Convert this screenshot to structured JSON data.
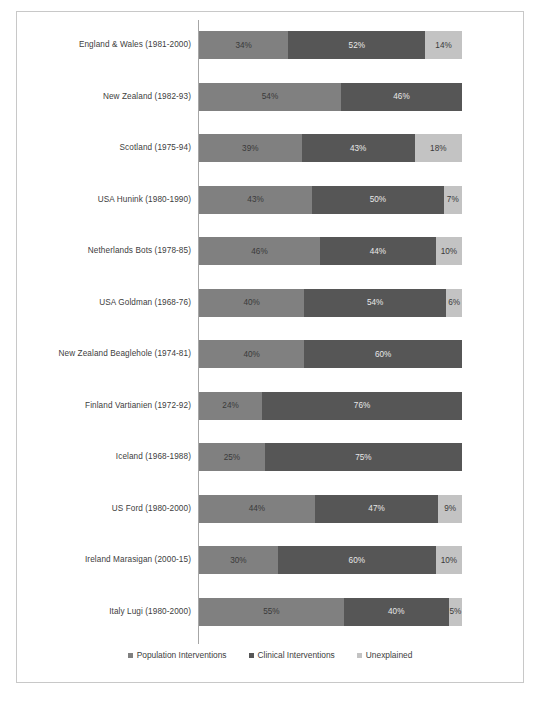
{
  "chart_data": {
    "type": "bar",
    "orientation": "horizontal",
    "stacked": true,
    "stacked_percent": true,
    "title": "",
    "xlabel": "",
    "ylabel": "",
    "xlim": [
      0,
      100
    ],
    "grid": false,
    "legend_position": "bottom",
    "legend": [
      "Population Interventions",
      "Clinical Interventions",
      "Unexplained"
    ],
    "colors": [
      "#808080",
      "#565656",
      "#c3c3c3"
    ],
    "categories": [
      "England & Wales (1981-2000)",
      "New Zealand (1982-93)",
      "Scotland (1975-94)",
      "USA Hunink (1980-1990)",
      "Netherlands Bots (1978-85)",
      "USA Goldman (1968-76)",
      "New Zealand  Beaglehole (1974-81)",
      "Finland Vartianien (1972-92)",
      "Iceland (1968-1988)",
      "US Ford (1980-2000)",
      "Ireland Marasigan (2000-15)",
      "Italy Lugi (1980-2000)"
    ],
    "series": [
      {
        "name": "Population Interventions",
        "values": [
          34,
          54,
          39,
          43,
          46,
          40,
          40,
          24,
          25,
          44,
          30,
          55
        ]
      },
      {
        "name": "Clinical Interventions",
        "values": [
          52,
          46,
          43,
          50,
          44,
          54,
          60,
          76,
          75,
          47,
          60,
          40
        ]
      },
      {
        "name": "Unexplained",
        "values": [
          14,
          0,
          18,
          7,
          10,
          6,
          0,
          0,
          0,
          9,
          10,
          5
        ]
      }
    ],
    "rows": [
      {
        "label": "England & Wales (1981-2000)",
        "segments": [
          {
            "value": 34,
            "label": "34%"
          },
          {
            "value": 52,
            "label": "52%"
          },
          {
            "value": 14,
            "label": "14%"
          }
        ]
      },
      {
        "label": "New Zealand (1982-93)",
        "segments": [
          {
            "value": 54,
            "label": "54%"
          },
          {
            "value": 46,
            "label": "46%"
          },
          {
            "value": 0,
            "label": ""
          }
        ]
      },
      {
        "label": "Scotland (1975-94)",
        "segments": [
          {
            "value": 39,
            "label": "39%"
          },
          {
            "value": 43,
            "label": "43%"
          },
          {
            "value": 18,
            "label": "18%"
          }
        ]
      },
      {
        "label": "USA Hunink (1980-1990)",
        "segments": [
          {
            "value": 43,
            "label": "43%"
          },
          {
            "value": 50,
            "label": "50%"
          },
          {
            "value": 7,
            "label": "7%"
          }
        ]
      },
      {
        "label": "Netherlands Bots (1978-85)",
        "segments": [
          {
            "value": 46,
            "label": "46%"
          },
          {
            "value": 44,
            "label": "44%"
          },
          {
            "value": 10,
            "label": "10%"
          }
        ]
      },
      {
        "label": "USA Goldman (1968-76)",
        "segments": [
          {
            "value": 40,
            "label": "40%"
          },
          {
            "value": 54,
            "label": "54%"
          },
          {
            "value": 6,
            "label": "6%"
          }
        ]
      },
      {
        "label": "New Zealand  Beaglehole (1974-81)",
        "segments": [
          {
            "value": 40,
            "label": "40%"
          },
          {
            "value": 60,
            "label": "60%"
          },
          {
            "value": 0,
            "label": ""
          }
        ]
      },
      {
        "label": "Finland Vartianien (1972-92)",
        "segments": [
          {
            "value": 24,
            "label": "24%"
          },
          {
            "value": 76,
            "label": "76%"
          },
          {
            "value": 0,
            "label": ""
          }
        ]
      },
      {
        "label": "Iceland (1968-1988)",
        "segments": [
          {
            "value": 25,
            "label": "25%"
          },
          {
            "value": 75,
            "label": "75%"
          },
          {
            "value": 0,
            "label": ""
          }
        ]
      },
      {
        "label": "US Ford (1980-2000)",
        "segments": [
          {
            "value": 44,
            "label": "44%"
          },
          {
            "value": 47,
            "label": "47%"
          },
          {
            "value": 9,
            "label": "9%"
          }
        ]
      },
      {
        "label": "Ireland Marasigan (2000-15)",
        "segments": [
          {
            "value": 30,
            "label": "30%"
          },
          {
            "value": 60,
            "label": "60%"
          },
          {
            "value": 10,
            "label": "10%"
          }
        ]
      },
      {
        "label": "Italy Lugi (1980-2000)",
        "segments": [
          {
            "value": 55,
            "label": "55%"
          },
          {
            "value": 40,
            "label": "40%"
          },
          {
            "value": 5,
            "label": "5%"
          }
        ]
      }
    ]
  },
  "caption": ""
}
